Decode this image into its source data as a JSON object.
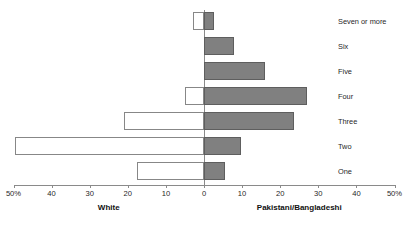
{
  "chart_data": {
    "type": "bar",
    "orientation": "horizontal-diverging",
    "title": "",
    "subtitle": "",
    "xlabel": "",
    "ylabel": "",
    "grid": false,
    "legend_position": "below-axis-as-group-titles",
    "categories": [
      "Seven or more",
      "Six",
      "Five",
      "Four",
      "Three",
      "Two",
      "One"
    ],
    "axis": {
      "tick_labels": [
        "50%",
        "40",
        "30",
        "20",
        "10",
        "0",
        "10",
        "20",
        "30",
        "40",
        "50%"
      ],
      "tick_values": [
        -50,
        -40,
        -30,
        -20,
        -10,
        0,
        10,
        20,
        30,
        40,
        50
      ],
      "xlim": [
        -50,
        50
      ],
      "left_max_percent": 50,
      "right_max_percent": 50
    },
    "series": [
      {
        "name": "White",
        "side": "left",
        "color": "#ffffff",
        "border_color": "#878787",
        "values": [
          3.0,
          0.0,
          0.0,
          5.0,
          21.0,
          49.5,
          17.5
        ]
      },
      {
        "name": "Pakistani/Bangladeshi",
        "side": "right",
        "color": "#808080",
        "border_color": "#5e5e5e",
        "values": [
          2.5,
          7.8,
          16.0,
          27.0,
          23.5,
          9.7,
          5.5
        ]
      }
    ],
    "group_titles": {
      "left": "White",
      "right": "Pakistani/Bangladeshi"
    }
  },
  "colors": {
    "axis": "#8a8a8a",
    "text": "#1f1f1f",
    "left_bar_fill": "#ffffff",
    "left_bar_border": "#878787",
    "right_bar_fill": "#808080",
    "right_bar_border": "#5e5e5e",
    "background": "#ffffff"
  }
}
